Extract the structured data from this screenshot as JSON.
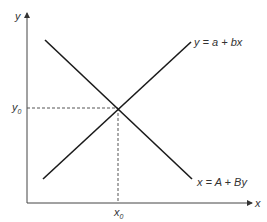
{
  "diagram": {
    "type": "supply-demand style intersecting lines",
    "axes": {
      "x_label": "x",
      "y_label": "y"
    },
    "lines": [
      {
        "name": "increasing",
        "equation": "y = a + bx"
      },
      {
        "name": "decreasing",
        "equation": "x = A + By"
      }
    ],
    "intersection": {
      "x_label_base": "x",
      "x_label_sub": "0",
      "y_label_base": "y",
      "y_label_sub": "0"
    },
    "colors": {
      "line": "#1a1a1a",
      "axis": "#333333",
      "dashed": "#444444",
      "text": "#333333"
    }
  }
}
